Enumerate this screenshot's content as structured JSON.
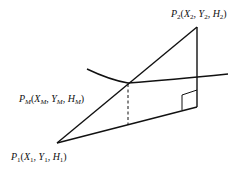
{
  "diagram": {
    "points": {
      "p1": {
        "name": "P",
        "sub": "1",
        "label_parts": [
          {
            "t": "(",
            "i": false
          },
          {
            "t": "X",
            "i": true
          },
          {
            "t": "1",
            "s": true
          },
          {
            "t": ", ",
            "i": false
          },
          {
            "t": "Y",
            "i": true
          },
          {
            "t": "1",
            "s": true
          },
          {
            "t": ", ",
            "i": false
          },
          {
            "t": "H",
            "i": true
          },
          {
            "t": "1",
            "s": true
          },
          {
            "t": ")",
            "i": false
          }
        ],
        "text": "P1(X1, Y1, H1)"
      },
      "p2": {
        "name": "P",
        "sub": "2",
        "text": "P2(X2, Y2, H2)"
      },
      "pm": {
        "name": "P",
        "sub": "M",
        "text": "PM(XM, YM, HM)"
      }
    },
    "labels": {
      "p2_P": "P",
      "p2_sub": "2",
      "p2_rest1": "(X",
      "p2_s1": "2",
      "p2_rest2": ", Y",
      "p2_s2": "2",
      "p2_rest3": ", H",
      "p2_s3": "2",
      "p2_end": ")",
      "pm_P": "P",
      "pm_sub": "M",
      "pm_rest1": "(X",
      "pm_s1": "M",
      "pm_rest2": ", Y",
      "pm_s2": "M",
      "pm_rest3": ", H",
      "pm_s3": "M",
      "pm_end": ")",
      "p1_P": "P",
      "p1_sub": "1",
      "p1_rest1": "(X",
      "p1_s1": "1",
      "p1_rest2": ", Y",
      "p1_s2": "1",
      "p1_rest3": ", H",
      "p1_s3": "1",
      "p1_end": ")"
    },
    "colors": {
      "line": "#111111",
      "background": "#ffffff"
    }
  }
}
